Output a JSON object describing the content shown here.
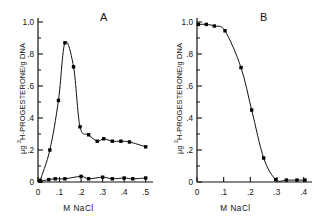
{
  "figure": {
    "axis_label_y": "µg ³H-PROGESTERONE/g DNA",
    "axis_label_y_prefix": "µg ",
    "axis_label_y_sup": "3",
    "axis_label_y_suffix": "H-PROGESTERONE/g DNA",
    "axis_label_x": "M  NaCl",
    "line_color": "#111111",
    "marker_color": "#000000",
    "background": "#ffffff"
  },
  "chart_data": [
    {
      "type": "line",
      "title": "A",
      "panel": "A",
      "xlabel": "M  NaCl",
      "ylabel": "µg 3H-PROGESTERONE/g DNA",
      "xlim": [
        0,
        0.52
      ],
      "ylim": [
        0,
        1.0
      ],
      "xticks": [
        0,
        0.1,
        0.2,
        0.3,
        0.4,
        0.5
      ],
      "xticklabels": [
        "0",
        ".1",
        ".2",
        ".3",
        ".4",
        ".5"
      ],
      "yticks": [
        0,
        0.2,
        0.4,
        0.6,
        0.8,
        1.0
      ],
      "yticklabels": [
        "0",
        ".2",
        ".4",
        ".6",
        ".8",
        "1.0"
      ],
      "minor_yticks": [
        0.1,
        0.3,
        0.5,
        0.7,
        0.9
      ],
      "grid": false,
      "legend": false,
      "series": [
        {
          "name": "bound-progesterone",
          "marker": "filled-square",
          "x": [
            0.01,
            0.055,
            0.095,
            0.125,
            0.165,
            0.195,
            0.235,
            0.275,
            0.305,
            0.345,
            0.385,
            0.425,
            0.5
          ],
          "y": [
            0.01,
            0.2,
            0.51,
            0.87,
            0.72,
            0.345,
            0.295,
            0.255,
            0.27,
            0.255,
            0.255,
            0.25,
            0.22
          ]
        },
        {
          "name": "baseline-control",
          "marker": "filled-square",
          "x": [
            0.01,
            0.05,
            0.08,
            0.125,
            0.2,
            0.235,
            0.3,
            0.345,
            0.4,
            0.44,
            0.5
          ],
          "y": [
            0.005,
            0.015,
            0.02,
            0.02,
            0.035,
            0.02,
            0.03,
            0.02,
            0.025,
            0.02,
            0.025
          ]
        }
      ]
    },
    {
      "type": "line",
      "title": "B",
      "panel": "B",
      "xlabel": "M  NaCl",
      "ylabel": "µg 3H-PROGESTERONE/g DNA",
      "xlim": [
        0,
        0.42
      ],
      "ylim": [
        0,
        1.0
      ],
      "xticks": [
        0,
        0.1,
        0.2,
        0.3,
        0.4
      ],
      "xticklabels": [
        "0",
        ".1",
        ".2",
        ".3",
        ".4"
      ],
      "yticks": [
        0,
        0.2,
        0.4,
        0.6,
        0.8,
        1.0
      ],
      "yticklabels": [
        "0",
        ".2",
        ".4",
        ".6",
        ".8",
        "1.0"
      ],
      "minor_yticks": [
        0.1,
        0.3,
        0.5,
        0.7,
        0.9
      ],
      "grid": false,
      "legend": false,
      "series": [
        {
          "name": "bound-progesterone",
          "marker": "filled-square",
          "x": [
            0.005,
            0.035,
            0.065,
            0.105,
            0.165,
            0.205,
            0.25,
            0.295,
            0.335,
            0.375,
            0.405
          ],
          "y": [
            0.985,
            0.985,
            0.975,
            0.945,
            0.715,
            0.45,
            0.15,
            0.015,
            0.012,
            0.012,
            0.012
          ]
        }
      ]
    }
  ]
}
